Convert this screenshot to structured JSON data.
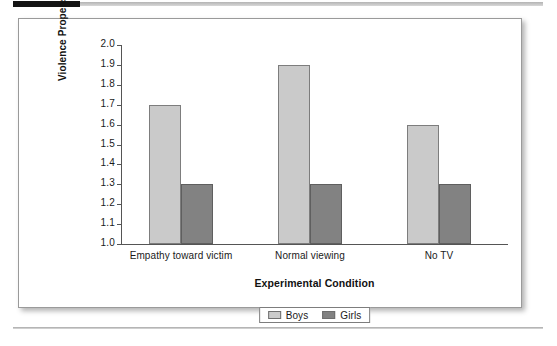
{
  "decorations": {
    "top_black_bar": "black-rule-segment",
    "top_gray_bar": "gray-rule-segment",
    "bottom_rule": "gray-rule"
  },
  "colors": {
    "boys_fill": "#cacaca",
    "girls_fill": "#828282",
    "bar_outline": "#7d7d7d",
    "axis": "#555555",
    "text": "#1a1a1a",
    "card_border": "#9a9a9a",
    "page_background": "#ffffff"
  },
  "chart_data": {
    "type": "bar",
    "title": "",
    "xlabel": "Experimental Condition",
    "ylabel": "Violence Propensity",
    "categories": [
      "Empathy toward victim",
      "Normal viewing",
      "No TV"
    ],
    "series": [
      {
        "name": "Boys",
        "values": [
          1.7,
          1.9,
          1.6
        ],
        "color": "#cacaca"
      },
      {
        "name": "Girls",
        "values": [
          1.3,
          1.3,
          1.3
        ],
        "color": "#828282"
      }
    ],
    "ylim": [
      1.0,
      2.0
    ],
    "ytick_step": 0.1,
    "yticks": [
      "2.0",
      "1.9",
      "1.8",
      "1.7",
      "1.6",
      "1.5",
      "1.4",
      "1.3",
      "1.2",
      "1.1",
      "1.0"
    ],
    "grid": false,
    "legend_position": "bottom-center",
    "legend_entries": [
      "Boys",
      "Girls"
    ]
  }
}
